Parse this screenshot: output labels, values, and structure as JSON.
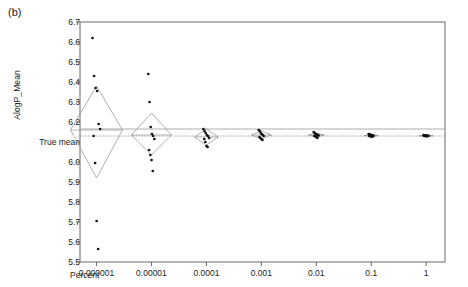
{
  "panel": {
    "label": "(b)"
  },
  "chart_data": {
    "type": "scatter",
    "title": "",
    "xlabel": "Percent",
    "ylabel": "AlogP_Mean",
    "xscale": "log",
    "xlim": [
      5e-07,
      2.2
    ],
    "ylim": [
      5.5,
      6.7
    ],
    "grid": false,
    "legend": null,
    "true_mean": 6.13,
    "true_mean_label": "True mean",
    "grand_mean_line": 6.165,
    "ytick_values": [
      6.7,
      6.6,
      6.5,
      6.4,
      6.3,
      6.2,
      6.1,
      6.0,
      5.9,
      5.8,
      5.7,
      5.6,
      5.5
    ],
    "ytick_labels": [
      "6.7",
      "6.6",
      "6.5",
      "6.4",
      "6.3",
      "6.2",
      "True mean",
      "6.0",
      "5.9",
      "5.8",
      "5.7",
      "5.6",
      "5.5"
    ],
    "xtick_values": [
      1e-06,
      1e-05,
      0.0001,
      0.001,
      0.01,
      0.1,
      1
    ],
    "xtick_labels": [
      "0.000001",
      "0.00001",
      "0.0001",
      "0.001",
      "0.01",
      "0.1",
      "1"
    ],
    "groups": [
      {
        "x": 1e-06,
        "mean": 6.16,
        "diamond_low": 5.92,
        "diamond_high": 6.38,
        "points": [
          6.62,
          6.43,
          6.37,
          6.355,
          6.19,
          6.165,
          6.13,
          5.995,
          5.705,
          5.565
        ]
      },
      {
        "x": 1e-05,
        "mean": 6.135,
        "diamond_low": 6.035,
        "diamond_high": 6.245,
        "points": [
          6.44,
          6.3,
          6.175,
          6.14,
          6.13,
          6.115,
          6.06,
          6.035,
          6.01,
          5.955
        ]
      },
      {
        "x": 0.0001,
        "mean": 6.125,
        "diamond_low": 6.085,
        "diamond_high": 6.165,
        "points": [
          6.165,
          6.155,
          6.145,
          6.135,
          6.13,
          6.12,
          6.115,
          6.1,
          6.08,
          6.075
        ]
      },
      {
        "x": 0.001,
        "mean": 6.135,
        "diamond_low": 6.115,
        "diamond_high": 6.155,
        "points": [
          6.16,
          6.155,
          6.145,
          6.14,
          6.135,
          6.13,
          6.125,
          6.12,
          6.115,
          6.11
        ]
      },
      {
        "x": 0.01,
        "mean": 6.135,
        "diamond_low": 6.125,
        "diamond_high": 6.145,
        "points": [
          6.15,
          6.145,
          6.14,
          6.138,
          6.135,
          6.132,
          6.13,
          6.128,
          6.125,
          6.12
        ]
      },
      {
        "x": 0.1,
        "mean": 6.132,
        "diamond_low": 6.127,
        "diamond_high": 6.138,
        "points": [
          6.14,
          6.138,
          6.136,
          6.134,
          6.132,
          6.131,
          6.13,
          6.129,
          6.128,
          6.126
        ]
      },
      {
        "x": 1,
        "mean": 6.131,
        "diamond_low": 6.129,
        "diamond_high": 6.134,
        "points": [
          6.134,
          6.133,
          6.132,
          6.132,
          6.131,
          6.131,
          6.13,
          6.13,
          6.129,
          6.129
        ]
      }
    ]
  },
  "colors": {
    "axis": "#5a5a5a",
    "point": "#121212",
    "diamond": "#9a9a9a",
    "mean_line": "#9a9a9a",
    "true_mean_line": "#8a8a8a",
    "text": "#222222"
  }
}
